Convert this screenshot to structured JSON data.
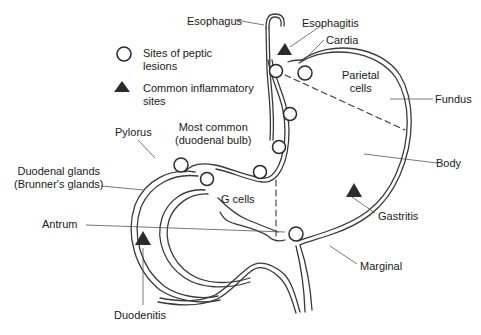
{
  "legend": {
    "lesion_label_line1": "Sites of peptic",
    "lesion_label_line2": "lesions",
    "inflam_label_line1": "Common inflammatory",
    "inflam_label_line2": "sites"
  },
  "labels": {
    "esophagus": "Esophagus",
    "esophagitis": "Esophagitis",
    "cardia": "Cardia",
    "parietal_line1": "Parietal",
    "parietal_line2": "cells",
    "fundus": "Fundus",
    "body": "Body",
    "pylorus": "Pylorus",
    "most_common_line1": "Most common",
    "most_common_line2": "(duodenal bulb)",
    "duodenal_glands_line1": "Duodenal glands",
    "duodenal_glands_line2": "(Brunner's glands)",
    "g_cells": "G cells",
    "antrum": "Antrum",
    "gastritis": "Gastritis",
    "marginal": "Marginal",
    "duodenitis": "Duodenitis"
  },
  "colors": {
    "line": "#3a3a3a",
    "marker_fill": "#2b2b2b",
    "text": "#1a1a1a"
  }
}
